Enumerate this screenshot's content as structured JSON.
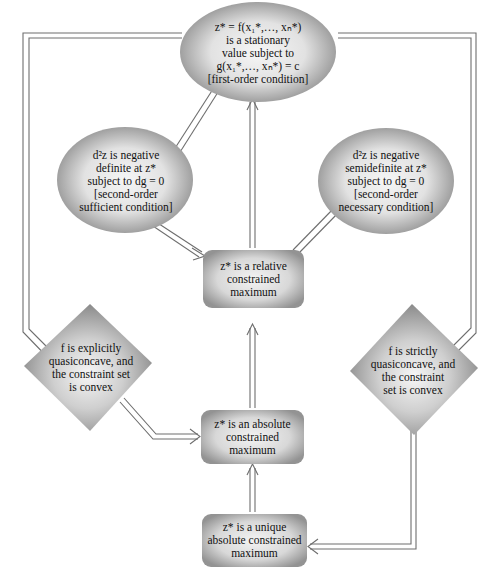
{
  "diagram": {
    "type": "flowchart",
    "nodes": {
      "stationary": {
        "shape": "ellipse",
        "lines": [
          "z* = f(x₁*,…, xₙ*)",
          "is a stationary",
          "value subject to",
          "g(x₁*,…, xₙ*) = c",
          "[first-order condition]"
        ]
      },
      "sufficient": {
        "shape": "ellipse",
        "lines": [
          "d²z is negative",
          "definite at z*",
          "subject to dg = 0",
          "[second-order",
          "sufficient condition]"
        ]
      },
      "necessary": {
        "shape": "ellipse",
        "lines": [
          "d²z is negative",
          "semidefinite at z*",
          "subject to dg = 0",
          "[second-order",
          "necessary condition]"
        ]
      },
      "relative_max": {
        "shape": "rounded-rect",
        "lines": [
          "z* is a relative",
          "constrained",
          "maximum"
        ]
      },
      "explicit_quasi": {
        "shape": "diamond",
        "lines": [
          "f is explicitly",
          "quasiconcave, and",
          "the constraint set",
          "is convex"
        ]
      },
      "strict_quasi": {
        "shape": "diamond",
        "lines": [
          "f is strictly",
          "quasiconcave, and",
          "the constraint",
          "set is convex"
        ]
      },
      "absolute_max": {
        "shape": "rounded-rect",
        "lines": [
          "z* is an absolute",
          "constrained",
          "maximum"
        ]
      },
      "unique_max": {
        "shape": "rounded-rect",
        "lines": [
          "z* is a unique",
          "absolute constrained",
          "maximum"
        ]
      }
    },
    "edges": [
      {
        "from": "sufficient",
        "to": "stationary",
        "arrow": "none"
      },
      {
        "from": "sufficient",
        "to": "relative_max",
        "arrow": "end"
      },
      {
        "from": "relative_max",
        "to": "stationary",
        "arrow": "end"
      },
      {
        "from": "relative_max",
        "to": "necessary",
        "arrow": "end"
      },
      {
        "from": "absolute_max",
        "to": "relative_max",
        "arrow": "end"
      },
      {
        "from": "unique_max",
        "to": "absolute_max",
        "arrow": "end"
      },
      {
        "from": "explicit_quasi",
        "to": "absolute_max",
        "arrow": "end"
      },
      {
        "from": "explicit_quasi",
        "to": "stationary",
        "arrow": "none"
      },
      {
        "from": "strict_quasi",
        "to": "stationary",
        "arrow": "none"
      },
      {
        "from": "strict_quasi",
        "to": "unique_max",
        "arrow": "end"
      }
    ],
    "colors": {
      "shape_light": "#f4f4f4",
      "shape_dark": "#8c8c8c",
      "line": "#6e6e6e",
      "text": "#111111"
    }
  }
}
